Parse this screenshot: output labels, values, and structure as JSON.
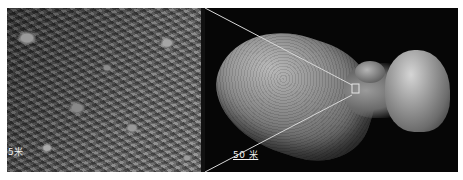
{
  "figure": {
    "left_panel": {
      "description": "close-up of boulder-strewn asteroid surface",
      "scale_label": "5米"
    },
    "right_panel": {
      "description": "full view of peanut-shaped asteroid with inset box marking the close-up region",
      "scale_label": "50 米"
    },
    "colors": {
      "background": "#ffffff",
      "space": "#060606",
      "callout_lines": "#d8d8d8",
      "label_text": "#f2f2f2"
    }
  }
}
